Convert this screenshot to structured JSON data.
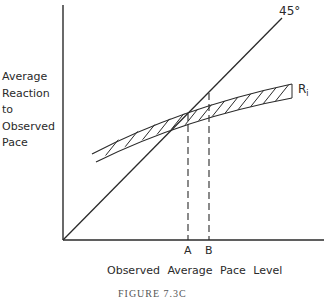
{
  "diagram": {
    "y_axis_label": [
      "Average",
      "Reaction",
      "to",
      "Observed",
      "Pace"
    ],
    "x_axis_label": "Observed Average Pace Level",
    "line_label": "45°",
    "curve_label": "R",
    "curve_subscript": "i",
    "tick_labels": [
      "A",
      "B"
    ],
    "caption": "FIGURE 7.3C",
    "colors": {
      "ink": "#2a2a2a",
      "background": "#ffffff"
    }
  }
}
